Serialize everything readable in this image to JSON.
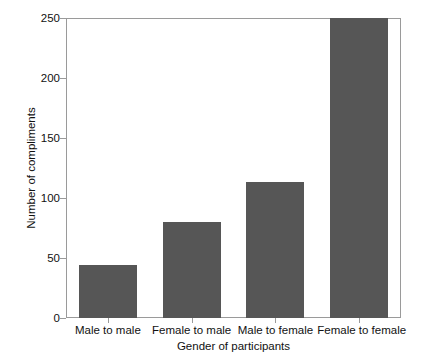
{
  "chart_data": {
    "type": "bar",
    "title": "",
    "subtitle": "",
    "xlabel": "Gender of participants",
    "ylabel": "Number of compliments",
    "categories": [
      "Male to male",
      "Female to male",
      "Male to female",
      "Female to female"
    ],
    "values": [
      44,
      80,
      113,
      250
    ],
    "ylim": [
      0,
      250
    ],
    "yticks": [
      0,
      50,
      100,
      150,
      200,
      250
    ],
    "ytick_labels": [
      "0",
      "50",
      "100",
      "150",
      "200",
      "250"
    ],
    "grid": false,
    "legend": null,
    "bar_color": "#565656",
    "axis_color": "#9a9a9a",
    "frame": true,
    "annotations": []
  },
  "figure": {
    "background": "#ffffff",
    "text_color": "#111111"
  }
}
